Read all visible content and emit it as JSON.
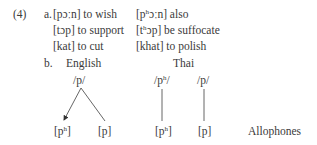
{
  "example": {
    "number": "(4)",
    "part_a": {
      "label": "a.",
      "rows": [
        {
          "left_form": "[pɔːn]",
          "left_gloss": "to wish",
          "right_base": "[p",
          "right_sup": "h",
          "right_rest": "ɔːn]",
          "right_gloss": "also"
        },
        {
          "left_form": "[tɔp]",
          "left_gloss": "to support",
          "right_base": "[t",
          "right_sup": "h",
          "right_rest": "ɔp]",
          "right_gloss": "be suffocate"
        },
        {
          "left_form": "[kat]",
          "left_gloss": "to cut",
          "right_base": "[khat]",
          "right_sup": "",
          "right_rest": "",
          "right_gloss": "to polish"
        }
      ]
    },
    "part_b": {
      "label": "b.",
      "english": {
        "heading": "English",
        "phoneme": "/p/",
        "allophones": [
          {
            "base": "[p",
            "sup": "h",
            "end": "]"
          },
          {
            "base": "[p]",
            "sup": "",
            "end": ""
          }
        ]
      },
      "thai": {
        "heading": "Thai",
        "phonemes": [
          {
            "base": "/p",
            "sup": "h",
            "end": "/"
          },
          {
            "base": "/p/",
            "sup": "",
            "end": ""
          }
        ],
        "allophones": [
          {
            "base": "[p",
            "sup": "h",
            "end": "]"
          },
          {
            "base": "[p]",
            "sup": "",
            "end": ""
          }
        ]
      },
      "row_label": "Allophones"
    }
  }
}
